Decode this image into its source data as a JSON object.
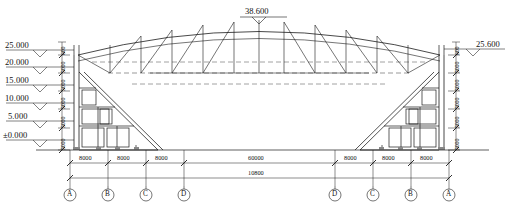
{
  "drawing": {
    "type": "structural-elevation",
    "title_symbol": "elevation-marker-triangle",
    "apex": {
      "label": "38.600",
      "name": "apex-elevation"
    },
    "left_elevations": [
      {
        "label": "25.000",
        "y": 48
      },
      {
        "label": "20.000",
        "y": 65
      },
      {
        "label": "15.000",
        "y": 83
      },
      {
        "label": "10.000",
        "y": 101
      },
      {
        "label": "5.000",
        "y": 119
      },
      {
        "label": "±0.000",
        "y": 140
      }
    ],
    "right_elevations": [
      {
        "label": "25.600",
        "y": 47
      }
    ],
    "vertical_dims_left": [
      "600",
      "5000",
      "5000",
      "5000",
      "5000",
      "5000"
    ],
    "vertical_dims_right": [
      "600",
      "5000",
      "5000",
      "5000",
      "5000",
      "5000"
    ],
    "bottom_dims_left": [
      "8000",
      "8000",
      "8000"
    ],
    "bottom_dims_right": [
      "8000",
      "8000",
      "8000"
    ],
    "center_span": "60000",
    "total_span": "10800",
    "grid_bubbles_left": [
      "A",
      "B",
      "C",
      "D"
    ],
    "grid_bubbles_right": [
      "D",
      "C",
      "B",
      "A"
    ],
    "colors": {
      "line": "#1a1a1a",
      "thin_line": "#444444",
      "dashed_line": "#555555",
      "background": "#ffffff"
    }
  }
}
